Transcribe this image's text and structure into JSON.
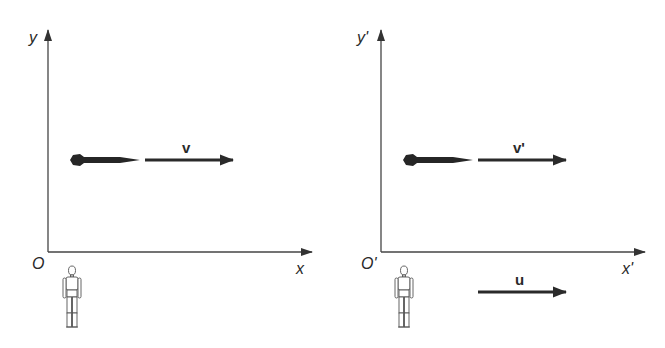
{
  "diagram": {
    "type": "reference-frames-relative-velocity",
    "colors": {
      "ink": "#2a2a2a",
      "axis": "#444444",
      "background": "#ffffff"
    },
    "frames": [
      {
        "id": "S",
        "axis_labels": {
          "y": "y",
          "x": "x",
          "origin": "O"
        },
        "object": {
          "name": "rocket",
          "velocity_label": "v"
        },
        "observer": "standing-figure"
      },
      {
        "id": "S-prime",
        "axis_labels": {
          "y": "y'",
          "x": "x'",
          "origin": "O'"
        },
        "object": {
          "name": "rocket",
          "velocity_label": "v'"
        },
        "observer": "standing-figure",
        "frame_velocity_label": "u"
      }
    ]
  }
}
